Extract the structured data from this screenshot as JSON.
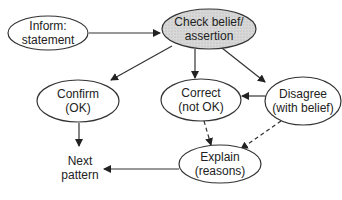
{
  "diagram": {
    "type": "flow",
    "nodes": [
      {
        "id": "inform",
        "line1": "Inform:",
        "line2": "statement",
        "cx": 48,
        "cy": 26,
        "rx": 40,
        "ry": 17,
        "fill": "#ffffff",
        "shaded": false
      },
      {
        "id": "check",
        "line1": "Check belief/",
        "line2": "assertion",
        "cx": 209,
        "cy": 29,
        "rx": 47,
        "ry": 20,
        "fill": "#d4d4d4",
        "shaded": true
      },
      {
        "id": "confirm",
        "line1": "Confirm",
        "line2": "(OK)",
        "cx": 78,
        "cy": 102,
        "rx": 41,
        "ry": 21,
        "fill": "#ffffff",
        "shaded": false
      },
      {
        "id": "correct",
        "line1": "Correct",
        "line2": "(not OK)",
        "cx": 201,
        "cy": 100,
        "rx": 40,
        "ry": 21,
        "fill": "#ffffff",
        "shaded": false
      },
      {
        "id": "disagree",
        "line1": "Disagree",
        "line2": "(with belief)",
        "cx": 303,
        "cy": 101,
        "rx": 38,
        "ry": 24,
        "fill": "#ffffff",
        "shaded": false
      },
      {
        "id": "explain",
        "line1": "Explain",
        "line2": "(reasons)",
        "cx": 220,
        "cy": 164,
        "rx": 41,
        "ry": 19,
        "fill": "#ffffff",
        "shaded": false
      },
      {
        "id": "next",
        "line1": "Next",
        "line2": "pattern",
        "cx": 80,
        "cy": 168,
        "boxless": true
      }
    ],
    "edges": [
      {
        "from": "inform",
        "to": "check",
        "style": "solid"
      },
      {
        "from": "check",
        "to": "confirm",
        "style": "solid"
      },
      {
        "from": "check",
        "to": "correct",
        "style": "solid"
      },
      {
        "from": "check",
        "to": "disagree",
        "style": "solid"
      },
      {
        "from": "disagree",
        "to": "correct",
        "style": "solid"
      },
      {
        "from": "confirm",
        "to": "next",
        "style": "solid"
      },
      {
        "from": "correct",
        "to": "explain",
        "style": "dashed"
      },
      {
        "from": "disagree",
        "to": "explain",
        "style": "dashed"
      },
      {
        "from": "explain",
        "to": "next",
        "style": "solid"
      }
    ],
    "colors": {
      "stroke": "#333333",
      "shade": "#d4d4d4",
      "text": "#222222"
    }
  }
}
